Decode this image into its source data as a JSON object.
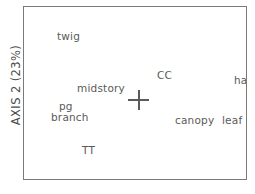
{
  "chart_data": {
    "type": "scatter",
    "title": "",
    "subtitle": "",
    "xlabel": "",
    "ylabel": "AXIS 2 (23%)",
    "grid": false,
    "legend": "none",
    "axis_tick_labels": [],
    "origin_marker": {
      "name": "origin-cross",
      "symbol": "+",
      "x_px": 137,
      "y_px": 99
    },
    "labels_only_no_markers": true,
    "points": [
      {
        "label": "twig",
        "x_px": 56,
        "y_px": 29,
        "anchor": "left-top"
      },
      {
        "label": "midstory",
        "x_px": 76,
        "y_px": 81,
        "anchor": "left-top"
      },
      {
        "label": "CC",
        "x_px": 156,
        "y_px": 68,
        "anchor": "left-top"
      },
      {
        "label": "ha",
        "x_px": 233,
        "y_px": 73,
        "anchor": "left-top"
      },
      {
        "label": "pg",
        "x_px": 58,
        "y_px": 99,
        "anchor": "left-top"
      },
      {
        "label": "branch",
        "x_px": 50,
        "y_px": 110,
        "anchor": "left-top"
      },
      {
        "label": "canopy",
        "x_px": 174,
        "y_px": 113,
        "anchor": "left-top"
      },
      {
        "label": "leaf",
        "x_px": 221,
        "y_px": 113,
        "anchor": "left-top"
      },
      {
        "label": "TT",
        "x_px": 81,
        "y_px": 143,
        "anchor": "left-top"
      }
    ],
    "colors": {
      "background": "#ffffff",
      "frame": "#7a7a7a",
      "text": "#5a5a5a",
      "axis_title": "#4d4d4d",
      "marker": "#5a5a5a"
    }
  }
}
